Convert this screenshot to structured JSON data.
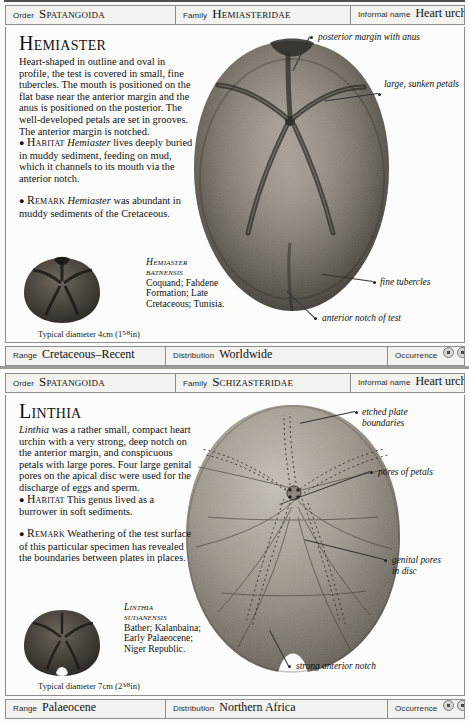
{
  "entries": [
    {
      "header": {
        "order_label": "Order",
        "order_value": "Spatangoida",
        "family_label": "Family",
        "family_value": "Hemiasteridae",
        "informal_label": "Informal name",
        "informal_value": "Heart urchin"
      },
      "genus": "Hemiaster",
      "description": "Heart-shaped in outline and oval in profile, the test is covered in small, fine tubercles. The mouth is positioned on the flat base near the anterior margin and the anus is positioned on the posterior. The well-developed petals are set in grooves. The anterior margin is notched.",
      "habitat_label": "Habitat",
      "habitat_genus": "Hemiaster",
      "habitat_text": "lives deeply buried in muddy sediment, feeding on mud, which it channels to its mouth via the anterior notch.",
      "remark_label": "Remark",
      "remark_genus": "Hemiaster",
      "remark_text": "was abundant in muddy sediments of the Cretaceous.",
      "thumb_caption": "Typical diameter 4cm (1",
      "thumb_caption_frac": "5⁄8",
      "thumb_caption_end": "in)",
      "specimen_species_line1": "Hemiaster",
      "specimen_species_line2": "batnensis",
      "specimen_detail": "Coquand; Fahdene Formation; Late Cretaceous; Tunisia.",
      "annotations": [
        "posterior margin with anus",
        "large, sunken petals",
        "fine tubercles",
        "anterior notch of test"
      ],
      "footer": {
        "range_label": "Range",
        "range_value": "Cretaceous–Recent",
        "distribution_label": "Distribution",
        "distribution_value": "Worldwide",
        "occurrence_label": "Occurrence",
        "occurrence_count": 3
      }
    },
    {
      "header": {
        "order_label": "Order",
        "order_value": "Spatangoida",
        "family_label": "Family",
        "family_value": "Schizasteridae",
        "informal_label": "Informal name",
        "informal_value": "Heart urchin"
      },
      "genus": "Linthia",
      "description_genus": "Linthia",
      "description": "was a rather small, compact heart urchin with a very strong, deep notch on the anterior margin, and conspicuous petals with large pores. Four large genital pores on the apical disc were used for the discharge of eggs and sperm.",
      "habitat_label": "Habitat",
      "habitat_text": "This genus lived as a burrower in soft sediments.",
      "remark_label": "Remark",
      "remark_text": "Weathering of the test surface of this particular specimen has revealed the boundaries between plates in places.",
      "thumb_caption": "Typical diameter 7cm (2",
      "thumb_caption_frac": "3⁄8",
      "thumb_caption_end": "in)",
      "specimen_species_line1": "Linthia",
      "specimen_species_line2": "sudanensis",
      "specimen_detail": "Bather; Kalanbaina; Early Palaeocene; Niger Republic.",
      "annotations": [
        "etched plate boundaries",
        "pores of petals",
        "genital pores in disc",
        "strong anterior notch"
      ],
      "footer": {
        "range_label": "Range",
        "range_value": "Palaeocene",
        "distribution_label": "Distribution",
        "distribution_value": "Northern Africa",
        "occurrence_label": "Occurrence",
        "occurrence_count": 2
      }
    }
  ]
}
